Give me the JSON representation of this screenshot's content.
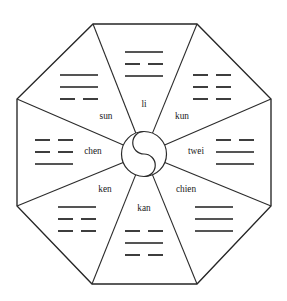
{
  "figure": {
    "background_color": "#ffffff",
    "line_color": "#262626",
    "text_color": "#1a1a1a"
  },
  "center": {
    "symbol_name": "taiji-yin-yang",
    "cx": 144,
    "cy": 154,
    "radius": 22.5
  },
  "octagon": {
    "cx": 144,
    "cy": 154,
    "circumradius": 134,
    "vertices": [
      {
        "x": 93,
        "y": 24
      },
      {
        "x": 197,
        "y": 24
      },
      {
        "x": 271,
        "y": 99
      },
      {
        "x": 271,
        "y": 206
      },
      {
        "x": 197,
        "y": 284
      },
      {
        "x": 92,
        "y": 284
      },
      {
        "x": 17,
        "y": 206
      },
      {
        "x": 17,
        "y": 99
      }
    ]
  },
  "sectors": [
    {
      "id": "li",
      "label": "li",
      "position": "top",
      "angle_deg": -90,
      "label_x": 144,
      "label_y": 105,
      "trigram_x": 144,
      "trigram_y": 64,
      "lines": [
        "solid",
        "broken",
        "solid"
      ]
    },
    {
      "id": "kun",
      "label": "kun",
      "position": "top-right",
      "angle_deg": -45,
      "label_x": 182,
      "label_y": 117,
      "trigram_x": 212,
      "trigram_y": 87,
      "lines": [
        "broken",
        "broken",
        "broken"
      ]
    },
    {
      "id": "twei",
      "label": "twei",
      "position": "right",
      "angle_deg": 0,
      "label_x": 196,
      "label_y": 152,
      "trigram_x": 235,
      "trigram_y": 152,
      "lines": [
        "broken",
        "solid",
        "solid"
      ]
    },
    {
      "id": "chien",
      "label": "chien",
      "position": "bottom-right",
      "angle_deg": 45,
      "label_x": 186,
      "label_y": 190,
      "trigram_x": 214,
      "trigram_y": 219,
      "lines": [
        "solid",
        "solid",
        "solid"
      ]
    },
    {
      "id": "kan",
      "label": "kan",
      "position": "bottom",
      "angle_deg": 90,
      "label_x": 144,
      "label_y": 209,
      "trigram_x": 144,
      "trigram_y": 243,
      "lines": [
        "broken",
        "solid",
        "broken"
      ]
    },
    {
      "id": "ken",
      "label": "ken",
      "position": "bottom-left",
      "angle_deg": 135,
      "label_x": 105,
      "label_y": 190,
      "trigram_x": 77,
      "trigram_y": 219,
      "lines": [
        "solid",
        "broken",
        "broken"
      ]
    },
    {
      "id": "chen",
      "label": "chen",
      "position": "left",
      "angle_deg": 180,
      "label_x": 93,
      "label_y": 152,
      "trigram_x": 54,
      "trigram_y": 152,
      "lines": [
        "broken",
        "broken",
        "solid"
      ]
    },
    {
      "id": "sun",
      "label": "sun",
      "position": "top-left",
      "angle_deg": -135,
      "label_x": 106,
      "label_y": 117,
      "trigram_x": 79,
      "trigram_y": 87,
      "lines": [
        "solid",
        "solid",
        "broken"
      ]
    }
  ],
  "trigram_style": {
    "full_width": 38,
    "gap": 8,
    "row_spacing": 12
  }
}
